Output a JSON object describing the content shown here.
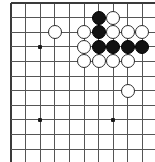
{
  "figure": {
    "name": "go-board-diagram",
    "kind": "go-board",
    "width": 155,
    "height": 162,
    "background": "#ffffff",
    "line_color": "#555555",
    "edge_line_color": "#3a3a3a",
    "black_color": "#121212",
    "white_color": "#ffffff",
    "white_outline_color": "#2b2b2b"
  },
  "board": {
    "origin_x": 11,
    "origin_y": 3,
    "spacing": 14.6,
    "columns": 10,
    "rows": 11,
    "edges": {
      "top": true,
      "left": true,
      "right": false,
      "bottom": false
    },
    "edge_line_width": 1.9,
    "inner_line_width": 1.0,
    "star_points": [
      {
        "col": 2,
        "row": 3
      },
      {
        "col": 2,
        "row": 8
      },
      {
        "col": 7,
        "row": 8
      }
    ]
  },
  "stones": {
    "radius": 7.1,
    "black_count": 7,
    "white_count": 13,
    "list": [
      {
        "color": "black",
        "col": 6,
        "row": 1
      },
      {
        "color": "white",
        "col": 7,
        "row": 1
      },
      {
        "color": "white",
        "col": 3,
        "row": 2
      },
      {
        "color": "white",
        "col": 5,
        "row": 2
      },
      {
        "color": "black",
        "col": 6,
        "row": 2
      },
      {
        "color": "white",
        "col": 7,
        "row": 2
      },
      {
        "color": "white",
        "col": 8,
        "row": 2
      },
      {
        "color": "white",
        "col": 9,
        "row": 2
      },
      {
        "color": "white",
        "col": 5,
        "row": 3
      },
      {
        "color": "black",
        "col": 6,
        "row": 3
      },
      {
        "color": "black",
        "col": 7,
        "row": 3
      },
      {
        "color": "black",
        "col": 8,
        "row": 3
      },
      {
        "color": "black",
        "col": 9,
        "row": 3
      },
      {
        "color": "white",
        "col": 5,
        "row": 4
      },
      {
        "color": "white",
        "col": 6,
        "row": 4
      },
      {
        "color": "white",
        "col": 7,
        "row": 4
      },
      {
        "color": "white",
        "col": 8,
        "row": 4
      },
      {
        "color": "white",
        "col": 8,
        "row": 6
      }
    ]
  },
  "labels": {
    "title": "",
    "caption": ""
  }
}
